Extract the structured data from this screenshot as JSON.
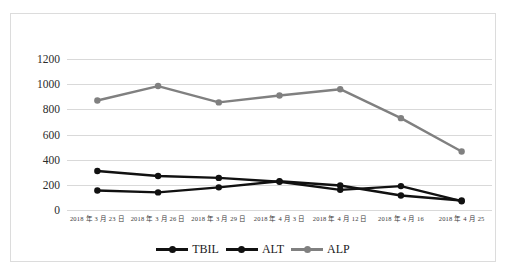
{
  "chart_data": {
    "type": "line",
    "title": "",
    "xlabel": "",
    "ylabel": "",
    "ylim": [
      0,
      1200
    ],
    "ytick_step": 200,
    "yticks": [
      "1200",
      "1000",
      "800",
      "600",
      "400",
      "200",
      "0"
    ],
    "grid": true,
    "legend_position": "bottom",
    "categories": [
      "2018 年 3 月 23 日",
      "2018 年 3 月 26 日",
      "2018 年 3 月 29 日",
      "2018 年 4 月 3 日",
      "2018 年 4 月 12 日",
      "2018 年 4 月 16",
      "2018 年 4 月 25"
    ],
    "series": [
      {
        "name": "TBIL",
        "color": "#111111",
        "values": [
          155,
          140,
          180,
          228,
          195,
          115,
          75
        ]
      },
      {
        "name": "ALT",
        "color": "#111111",
        "values": [
          310,
          270,
          255,
          225,
          160,
          190,
          70
        ]
      },
      {
        "name": "ALP",
        "color": "#808080",
        "values": [
          870,
          985,
          855,
          910,
          960,
          730,
          465
        ]
      }
    ]
  },
  "legend": {
    "items": [
      {
        "label": "TBIL",
        "color": "#111111",
        "icon": "line-marker-icon"
      },
      {
        "label": "ALT",
        "color": "#111111",
        "icon": "line-marker-icon"
      },
      {
        "label": "ALP",
        "color": "#808080",
        "icon": "line-marker-icon"
      }
    ]
  },
  "frame": {
    "border_color": "#dcdcdc",
    "background": "#ffffff",
    "gridline_color": "#d9d9d9"
  }
}
